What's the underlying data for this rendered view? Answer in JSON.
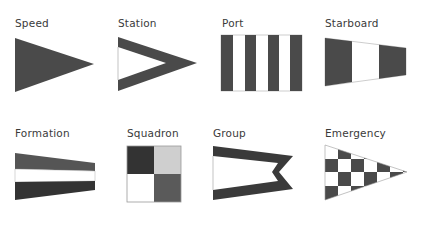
{
  "colors": {
    "dark": "#4a4a4a",
    "darker": "#333333",
    "light": "#cfcfcf",
    "white": "#ffffff",
    "outline": "#9a9a9a"
  },
  "flags": [
    {
      "id": "speed",
      "label": "Speed",
      "shape": "pennant-solid"
    },
    {
      "id": "station",
      "label": "Station",
      "shape": "pennant-open"
    },
    {
      "id": "port",
      "label": "Port",
      "shape": "vertical-stripes"
    },
    {
      "id": "starboard",
      "label": "Starboard",
      "shape": "tapered-vertical-bands"
    },
    {
      "id": "formation",
      "label": "Formation",
      "shape": "tapered-horizontal-bands"
    },
    {
      "id": "squadron",
      "label": "Squadron",
      "shape": "quartered-square"
    },
    {
      "id": "group",
      "label": "Group",
      "shape": "swallowtail-open"
    },
    {
      "id": "emergency",
      "label": "Emergency",
      "shape": "checkered-pennant"
    }
  ]
}
